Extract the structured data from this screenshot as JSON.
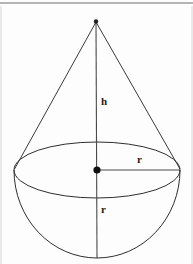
{
  "figure": {
    "background_color": "#fdfdfd",
    "line_color": "#2e2e2e",
    "canvas": {
      "width": 193,
      "height": 264
    }
  },
  "labels": {
    "height": "h",
    "radius_horizontal": "r",
    "radius_vertical": "r"
  },
  "geometry": {
    "apex": {
      "x": 96,
      "y": 21
    },
    "center": {
      "x": 97,
      "y": 170
    },
    "ellipse": {
      "cx": 97,
      "cy": 170,
      "rx": 83,
      "ry": 28
    },
    "hemisphere": {
      "cx": 97,
      "cy": 170,
      "r": 83,
      "bottom_y": 258
    },
    "vertical_axis": {
      "x1": 96,
      "y1": 21,
      "x2": 97,
      "y2": 258
    },
    "radius_segment": {
      "x1": 97,
      "y1": 170,
      "x2": 180,
      "y2": 170
    },
    "cone_left_edge": {
      "x1": 96,
      "y1": 21,
      "x2": 15,
      "y2": 170
    },
    "cone_right_edge": {
      "x1": 96,
      "y1": 21,
      "x2": 180,
      "y2": 170
    }
  },
  "markers": {
    "apex_dot_radius": 2.2,
    "center_dot_radius": 3.6
  },
  "scan_artifacts": {
    "top_rule_y": 3,
    "left_rule_x": 1,
    "right_rule_x": 192
  }
}
